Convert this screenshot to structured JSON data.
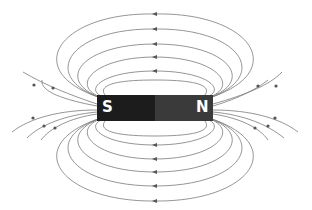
{
  "diagram": {
    "magnet": {
      "south_label": "S",
      "north_label": "N",
      "south_color": "#1c1c1c",
      "north_color": "#3a3a3a"
    },
    "field_line_color": "#777777",
    "arrow_color": "#555555",
    "field_direction": "from N to S outside the magnet",
    "top_loops": 6,
    "bottom_loops": 6,
    "side_lines_left": 5,
    "side_lines_right": 5
  }
}
